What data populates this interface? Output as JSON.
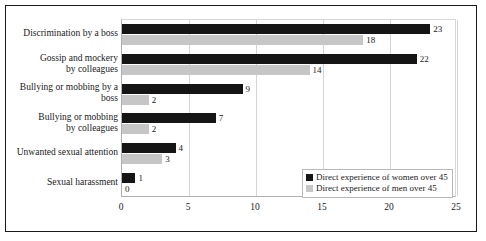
{
  "chart_data": {
    "type": "bar",
    "orientation": "horizontal",
    "title": "",
    "xlabel": "",
    "ylabel": "",
    "xlim": [
      0,
      25
    ],
    "xticks": [
      0,
      5,
      10,
      15,
      20,
      25
    ],
    "grid": true,
    "legend_position": "inside-bottom-right",
    "categories": [
      "Discrimination by a boss",
      "Gossip and mockery by colleagues",
      "Bullying or mobbing by a boss",
      "Bullying or mobbing by colleagues",
      "Unwanted sexual attention",
      "Sexual harassment"
    ],
    "category_lines": [
      [
        "Discrimination by a boss"
      ],
      [
        "Gossip and mockery",
        "by colleagues"
      ],
      [
        "Bullying or mobbing by a",
        "boss"
      ],
      [
        "Bullying or mobbing",
        "by colleagues"
      ],
      [
        "Unwanted sexual attention"
      ],
      [
        "Sexual harassment"
      ]
    ],
    "series": [
      {
        "name": "Direct experience of women over 45",
        "color": "#151515",
        "values": [
          23,
          22,
          9,
          7,
          4,
          1
        ]
      },
      {
        "name": "Direct experience of men over 45",
        "color": "#c6c6c6",
        "values": [
          18,
          14,
          2,
          2,
          3,
          0
        ]
      }
    ]
  },
  "legend": {
    "items": [
      {
        "label": "Direct experience of women over 45",
        "color": "#151515"
      },
      {
        "label": "Direct experience of men over 45",
        "color": "#c6c6c6"
      }
    ]
  }
}
